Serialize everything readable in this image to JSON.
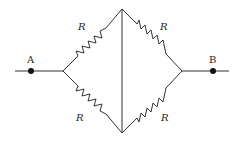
{
  "diagram": {
    "type": "resistor-bridge-circuit",
    "terminals": [
      {
        "id": "A",
        "label": "A"
      },
      {
        "id": "B",
        "label": "B"
      }
    ],
    "resistors": [
      {
        "position": "upper-left",
        "label": "R"
      },
      {
        "position": "upper-right",
        "label": "R"
      },
      {
        "position": "lower-left",
        "label": "R"
      },
      {
        "position": "lower-right",
        "label": "R"
      }
    ],
    "center_wire": "vertical wire connecting top and bottom nodes",
    "colors": {
      "wire": "#333333",
      "node": "#111111",
      "background": "#ffffff"
    }
  }
}
